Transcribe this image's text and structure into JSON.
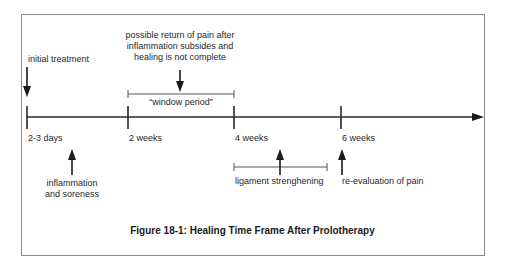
{
  "figure": {
    "caption": "Figure 18-1: Healing Time Frame After Prolotherapy",
    "line_color": "#2a2a2a",
    "frame_color": "#8a8a8a"
  },
  "timeline": {
    "ticks": [
      {
        "label": "2-3 days",
        "x": 27
      },
      {
        "label": "2 weeks",
        "x": 128
      },
      {
        "label": "4 weeks",
        "x": 234
      },
      {
        "label": "6 weeks",
        "x": 341
      }
    ]
  },
  "annotations": {
    "initial_treatment": "initial treatment",
    "possible_return_line1": "possible return of pain after",
    "possible_return_line2": "inflammation subsides and",
    "possible_return_line3": "healing is not complete",
    "window_period": "“window period”",
    "inflammation_line1": "inflammation",
    "inflammation_line2": "and soreness",
    "ligament_strengthening": "ligament strenghening",
    "re_evaluation": "re-evaluation of pain"
  }
}
